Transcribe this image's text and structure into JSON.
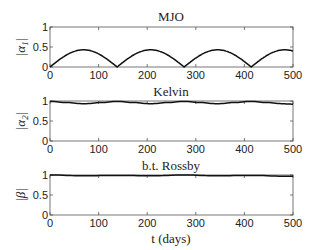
{
  "chart_data": [
    {
      "type": "line",
      "title": "MJO",
      "xlabel": "",
      "ylabel": "|α1|",
      "xlim": [
        0,
        500
      ],
      "ylim": [
        0,
        1
      ],
      "xticks": [
        "0",
        "100",
        "200",
        "300",
        "400",
        "500"
      ],
      "yticks": [
        "0",
        "0.5",
        "1"
      ],
      "grid": false,
      "series": [
        {
          "name": "|α1|",
          "x": [
            0,
            35,
            70,
            105,
            138,
            173,
            207,
            241,
            276,
            310,
            344,
            378,
            413,
            447,
            481,
            500
          ],
          "y": [
            0,
            0.32,
            0.43,
            0.32,
            0,
            0.32,
            0.43,
            0.32,
            0,
            0.32,
            0.43,
            0.32,
            0,
            0.32,
            0.43,
            0.39
          ]
        }
      ]
    },
    {
      "type": "line",
      "title": "Kelvin",
      "xlabel": "",
      "ylabel": "|α2|",
      "xlim": [
        0,
        500
      ],
      "ylim": [
        0,
        1
      ],
      "xticks": [
        "0",
        "100",
        "200",
        "300",
        "400",
        "500"
      ],
      "yticks": [
        "0",
        "0.5",
        "1"
      ],
      "grid": false,
      "series": [
        {
          "name": "|α2|",
          "x": [
            0,
            35,
            70,
            105,
            138,
            173,
            207,
            241,
            276,
            310,
            344,
            378,
            413,
            447,
            481,
            500
          ],
          "y": [
            0.99,
            0.96,
            0.93,
            0.96,
            0.99,
            0.96,
            0.93,
            0.96,
            0.99,
            0.96,
            0.93,
            0.96,
            0.99,
            0.96,
            0.93,
            0.92
          ]
        }
      ]
    },
    {
      "type": "line",
      "title": "b.t. Rossby",
      "xlabel": "t (days)",
      "ylabel": "|β|",
      "xlim": [
        0,
        500
      ],
      "ylim": [
        0,
        1
      ],
      "xticks": [
        "0",
        "100",
        "200",
        "300",
        "400",
        "500"
      ],
      "yticks": [
        "0",
        "0.5",
        "1"
      ],
      "grid": false,
      "series": [
        {
          "name": "|β|",
          "x": [
            0,
            70,
            138,
            207,
            276,
            344,
            413,
            481,
            500
          ],
          "y": [
            1.0,
            0.98,
            0.99,
            0.98,
            1.0,
            0.98,
            0.99,
            0.97,
            0.97
          ]
        }
      ]
    }
  ],
  "labels": {
    "panel1_title": "MJO",
    "panel2_title": "Kelvin",
    "panel3_title": "b.t. Rossby",
    "panel1_ylabel": "|α",
    "panel1_ylabel_sub": "1",
    "panel2_ylabel": "|α",
    "panel2_ylabel_sub": "2",
    "panel3_ylabel": "|β|",
    "xlabel": "t (days)",
    "xticks": [
      "0",
      "100",
      "200",
      "300",
      "400",
      "500"
    ],
    "yticks": [
      "0",
      "0.5",
      "1"
    ]
  }
}
